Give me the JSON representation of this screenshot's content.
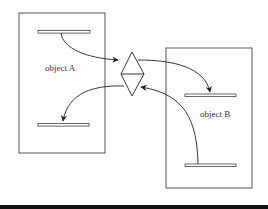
{
  "diagram": {
    "objects": [
      {
        "id": "a",
        "label": "object A"
      },
      {
        "id": "b",
        "label": "object B"
      }
    ],
    "connector": {
      "shape": "diamond",
      "split": "horizontal"
    },
    "colors": {
      "stroke": "#333333",
      "background": "#ffffff",
      "bottom_rule": "#111111"
    }
  }
}
